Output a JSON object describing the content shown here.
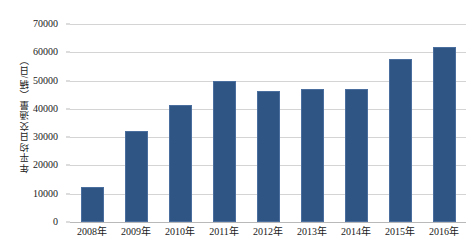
{
  "chart_data": {
    "type": "bar",
    "title": "",
    "subtitle": "",
    "xlabel": "",
    "ylabel": "年平均日交通量（辆/日）",
    "categories": [
      "2008年",
      "2009年",
      "2010年",
      "2011年",
      "2012年",
      "2013年",
      "2014年",
      "2015年",
      "2016年"
    ],
    "values": [
      12500,
      32200,
      41500,
      49900,
      46400,
      47100,
      47100,
      57700,
      61700
    ],
    "ylim": [
      0,
      70000
    ],
    "ytick_labels": [
      "0",
      "10000",
      "20000",
      "30000",
      "40000",
      "50000",
      "60000",
      "70000"
    ],
    "ytick_values": [
      0,
      10000,
      20000,
      30000,
      40000,
      50000,
      60000,
      70000
    ],
    "grid": "horizontal",
    "legend": "none",
    "series": [
      {
        "name": "年平均日交通量",
        "color": "#2e5584",
        "values": [
          12500,
          32200,
          41500,
          49900,
          46400,
          47100,
          47100,
          57700,
          61700
        ]
      }
    ],
    "colors": {
      "bar_fill": "#2e5584",
      "bar_border": "#4a6f9e",
      "gridline": "#d4d4d4",
      "axis": "#b9b9b9",
      "background": "#ffffff",
      "text": "#1a1a1a"
    }
  }
}
